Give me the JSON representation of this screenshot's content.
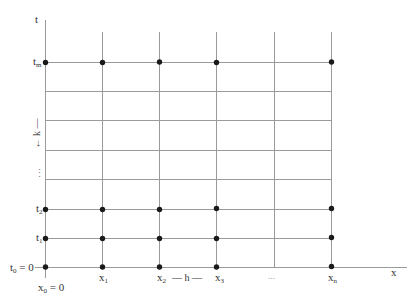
{
  "diagram": {
    "type": "finite-difference-grid",
    "axes": {
      "vertical_label": "t",
      "horizontal_label": "x"
    },
    "t_labels": [
      {
        "id": "tm",
        "base": "t",
        "sub": "m",
        "suffix": ""
      },
      {
        "id": "t2",
        "base": "t",
        "sub": "2",
        "suffix": ""
      },
      {
        "id": "t1",
        "base": "t",
        "sub": "1",
        "suffix": ""
      },
      {
        "id": "t0",
        "base": "t",
        "sub": "0",
        "suffix": " = 0"
      }
    ],
    "x_labels": [
      {
        "id": "x0",
        "base": "x",
        "sub": "0",
        "suffix": " = 0"
      },
      {
        "id": "x1",
        "base": "x",
        "sub": "1",
        "suffix": ""
      },
      {
        "id": "x2",
        "base": "x",
        "sub": "2",
        "suffix": ""
      },
      {
        "id": "x3",
        "base": "x",
        "sub": "3",
        "suffix": ""
      },
      {
        "id": "xn",
        "base": "x",
        "sub": "n",
        "suffix": ""
      }
    ],
    "spacing_labels": {
      "h": "— h —",
      "k": "← k —"
    },
    "ellipsis_x": "...",
    "ellipsis_t": "⋮",
    "colors": {
      "grid_line": "#9a9a9a",
      "node": "#1a1a1a",
      "text": "#333333"
    }
  }
}
